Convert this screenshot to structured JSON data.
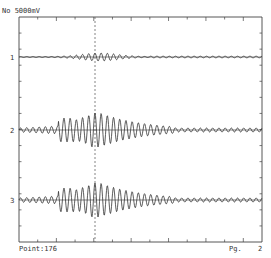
{
  "header": {
    "scale_label": "No 5000mV"
  },
  "footer": {
    "point_label": "Point:176",
    "page_label": "Pg.",
    "page_number": "2"
  },
  "plot": {
    "left": 19,
    "right": 262,
    "top": 17,
    "bottom": 242,
    "cursor_x": 95,
    "axis_color": "#444444",
    "trace_color": "#333333",
    "cursor_color": "#666666",
    "top_ticks": 13,
    "side_ticks": 14
  },
  "chart_data": {
    "type": "line",
    "title": "No 5000mV",
    "xlabel": "Point:176",
    "ylabel": "",
    "grid": false,
    "legend": null,
    "cursor_point": 176,
    "page": 2,
    "series": [
      {
        "name": "1",
        "label": "1",
        "baseline_y": 57,
        "peak_amplitude": 4,
        "envelope": "small burst around cursor, near-flat elsewhere"
      },
      {
        "name": "2",
        "label": "2",
        "baseline_y": 130,
        "peak_amplitude": 17,
        "envelope": "rises from ~x=55, max near cursor x=95, decays by ~x=175, low ripple to end"
      },
      {
        "name": "3",
        "label": "3",
        "baseline_y": 200,
        "peak_amplitude": 17,
        "envelope": "rises from ~x=55, max near cursor x=95, decays by ~x=175, low ripple to end"
      }
    ]
  }
}
